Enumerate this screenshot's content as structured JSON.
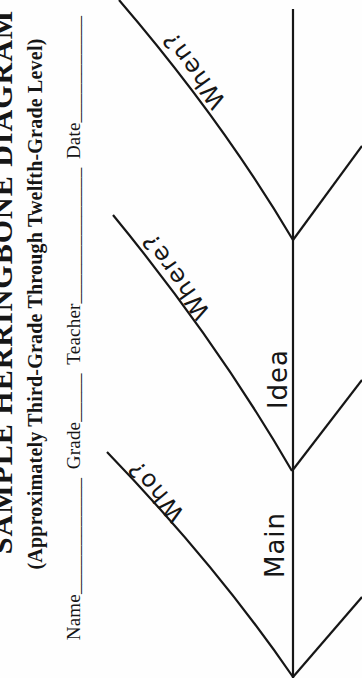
{
  "colors": {
    "ink": "#161616",
    "paper": "#fefefe"
  },
  "title": "SAMPLE HERRINGBONE DIAGRAM",
  "subtitle": "(Approximately Third-Grade Through Twelfth-Grade Level)",
  "header": {
    "fields": [
      {
        "label": "Name",
        "blank": "____________"
      },
      {
        "label": "Grade",
        "blank": "_____"
      },
      {
        "label": "Teacher",
        "blank": "______________"
      },
      {
        "label": "Date",
        "blank": "___________"
      }
    ]
  },
  "diagram": {
    "rib_labels": {
      "top": "When?",
      "middle": "Where?",
      "bottom": "Who?"
    },
    "spine_labels": {
      "upper": "Idea",
      "lower": "Main"
    }
  }
}
